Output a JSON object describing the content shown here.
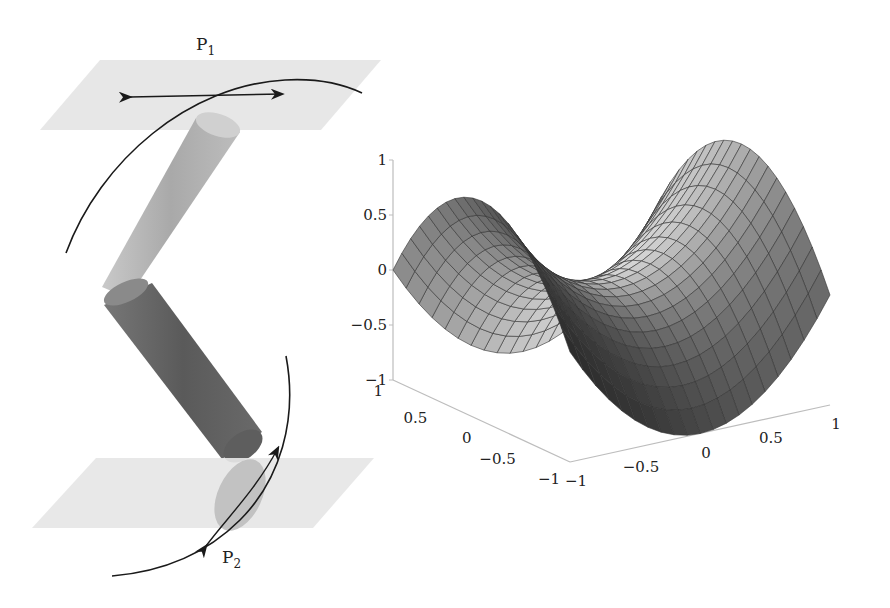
{
  "mechanism": {
    "plane_top_label": "P",
    "plane_top_sub": "1",
    "plane_bottom_label": "P",
    "plane_bottom_sub": "2",
    "plane_color": "#e4e4e4",
    "link_upper_color": "#b3b3b3",
    "link_lower_color": "#6e6e6e",
    "stroke_color": "#1a1a1a"
  },
  "chart_data": {
    "type": "surface",
    "title": "",
    "function": "z = v^2 - u^2 (saddle)",
    "xlabel": "",
    "ylabel": "",
    "zlabel": "",
    "grid_n": 20,
    "x_range": [
      -1,
      1
    ],
    "y_range": [
      -1,
      1
    ],
    "zlim": [
      -1,
      1
    ],
    "z_ticks": [
      "1",
      "0.5",
      "0",
      "−0.5",
      "−1"
    ],
    "left_axis_ticks": [
      "1",
      "0.5",
      "0",
      "−0.5",
      "−1"
    ],
    "right_axis_ticks": [
      "−1",
      "−0.5",
      "0",
      "0.5",
      "1"
    ],
    "surface_color_light": "#d8d8d8",
    "surface_color_dark": "#2a2a2a",
    "mesh_color": "#333333",
    "axis_color": "#bdbdbd"
  }
}
